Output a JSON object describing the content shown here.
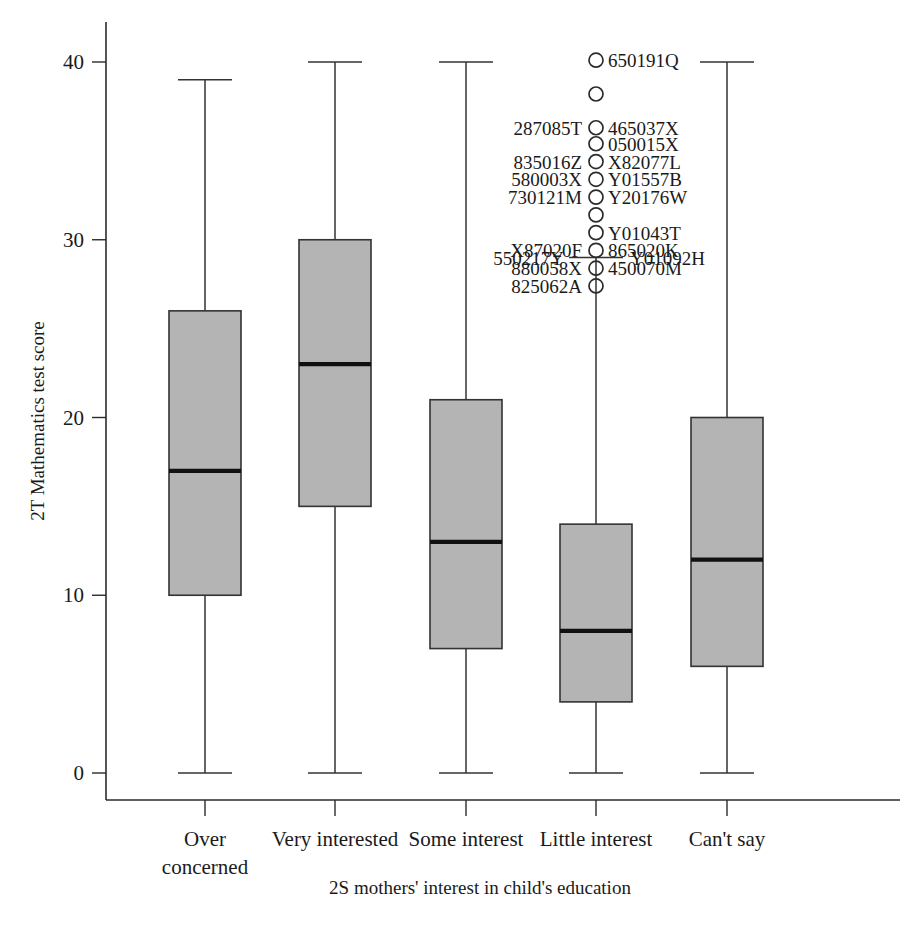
{
  "chart_data": {
    "type": "box",
    "title": "",
    "xlabel": "2S mothers' interest in child's education",
    "ylabel": "2T Mathematics test score",
    "categories": [
      "Over concerned",
      "Very interested",
      "Some interest",
      "Little interest",
      "Can't say"
    ],
    "category_lines": [
      [
        "Over",
        "concerned"
      ],
      [
        "Very interested"
      ],
      [
        "Some interest"
      ],
      [
        "Little interest"
      ],
      [
        "Can't say"
      ]
    ],
    "ylim": [
      0,
      41.5
    ],
    "yticks": [
      0,
      10,
      20,
      30,
      40
    ],
    "ytick_labels": [
      "0",
      "10",
      "20",
      "30",
      "40"
    ],
    "grid": false,
    "legend": "none",
    "boxes": [
      {
        "category": "Over concerned",
        "whisker_low": 0,
        "q1": 10,
        "median": 17,
        "q3": 26,
        "whisker_high": 39,
        "outliers": []
      },
      {
        "category": "Very interested",
        "whisker_low": 0,
        "q1": 15,
        "median": 23,
        "q3": 30,
        "whisker_high": 40,
        "outliers": []
      },
      {
        "category": "Some interest",
        "whisker_low": 0,
        "q1": 7,
        "median": 13,
        "q3": 21,
        "whisker_high": 40,
        "outliers": []
      },
      {
        "category": "Little interest",
        "whisker_low": 0,
        "q1": 4,
        "median": 8,
        "q3": 14,
        "whisker_high": 29,
        "outliers": [
          {
            "value": 40.1,
            "label_right": "650191Q",
            "label_left": ""
          },
          {
            "value": 38.2,
            "label_right": "",
            "label_left": ""
          },
          {
            "value": 36.3,
            "label_right": "465037X",
            "label_left": "287085T"
          },
          {
            "value": 35.4,
            "label_right": "050015X",
            "label_left": ""
          },
          {
            "value": 34.4,
            "label_right": "X82077L",
            "label_left": "835016Z"
          },
          {
            "value": 33.4,
            "label_right": "Y01557B",
            "label_left": "580003X"
          },
          {
            "value": 32.4,
            "label_right": "Y20176W",
            "label_left": "730121M"
          },
          {
            "value": 31.4,
            "label_right": "",
            "label_left": ""
          },
          {
            "value": 30.4,
            "label_right": "Y01043T",
            "label_left": ""
          },
          {
            "value": 29.4,
            "label_right": "865020K",
            "label_left": "X87020F"
          },
          {
            "value": 28.4,
            "label_right": "450070M",
            "label_left": "880058X"
          },
          {
            "value": 27.4,
            "label_right": "",
            "label_left": "825062A"
          }
        ],
        "whisker_high_labels": {
          "left": "550217Y",
          "right": "Y01092H"
        }
      },
      {
        "category": "Can't say",
        "whisker_low": 0,
        "q1": 6,
        "median": 12,
        "q3": 20,
        "whisker_high": 40,
        "outliers": []
      }
    ]
  },
  "colors": {
    "box_fill": "#b4b4b4",
    "box_stroke": "#333333",
    "median": "#111111",
    "axis": "#2b2b2b",
    "text": "#1a1a1a",
    "background": "#ffffff"
  }
}
